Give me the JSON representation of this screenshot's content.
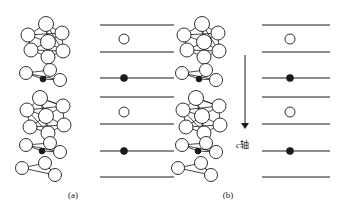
{
  "figure": {
    "width": 337,
    "height": 214,
    "background": "#ffffff",
    "stroke_color": "#1a1a1a",
    "panels": [
      {
        "id": "a",
        "caption": "(a)",
        "cluster_column_x": 50,
        "layer_column_x": 135
      },
      {
        "id": "b",
        "caption": "(b)",
        "cluster_column_x": 205,
        "layer_column_x": 296
      }
    ],
    "axis_arrow": {
      "label_italic": "c",
      "label_text": "轴",
      "x": 245,
      "y_start": 55,
      "y_end": 128
    },
    "layer_lines_y": [
      25,
      52,
      78,
      97,
      124,
      151,
      177
    ],
    "open_circle_rows_y": [
      39,
      112
    ],
    "filled_dot_rows_y": [
      78,
      151
    ],
    "open_circle_radius": 5,
    "filled_dot_radius": 3.2,
    "line_half_width": 40
  },
  "legend": {
    "open_circle_meaning": "open-circle-site",
    "filled_dot_meaning": "filled-dot-site"
  }
}
